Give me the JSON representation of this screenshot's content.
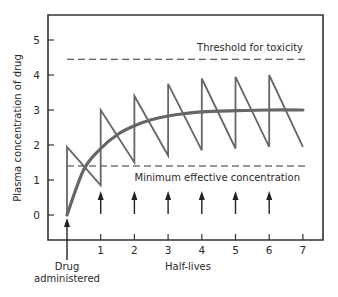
{
  "chart_data": {
    "type": "line",
    "title": "",
    "xlabel": "Half-lives",
    "ylabel": "Plasma concentration of drug",
    "xlim": [
      0,
      7
    ],
    "ylim": [
      0,
      5
    ],
    "x_ticks": [
      "1",
      "2",
      "3",
      "4",
      "5",
      "6",
      "7"
    ],
    "y_ticks": [
      "0",
      "1",
      "2",
      "3",
      "4",
      "5"
    ],
    "grid": false,
    "reference_lines": [
      {
        "name": "Threshold for toxicity",
        "y": 4.45,
        "style": "dashed"
      },
      {
        "name": "Minimum effective concentration",
        "y": 1.4,
        "style": "dashed"
      }
    ],
    "series": [
      {
        "name": "Intermittent dosing (sawtooth)",
        "x": [
          0,
          0,
          1,
          1,
          2,
          2,
          3,
          3,
          4,
          4,
          5,
          5,
          6,
          6,
          7
        ],
        "values": [
          0,
          1.95,
          0.85,
          3.0,
          1.5,
          3.4,
          1.7,
          3.75,
          1.85,
          3.9,
          1.9,
          3.95,
          1.95,
          4.0,
          1.95
        ]
      },
      {
        "name": "Continuous infusion (smooth)",
        "x": [
          0,
          0.5,
          1,
          1.5,
          2,
          2.5,
          3,
          3.5,
          4,
          5,
          6,
          7
        ],
        "values": [
          0,
          1.3,
          1.9,
          2.3,
          2.55,
          2.72,
          2.83,
          2.9,
          2.95,
          2.98,
          3.0,
          3.0
        ]
      }
    ],
    "dose_arrows_at": [
      0,
      1,
      2,
      3,
      4,
      5,
      6
    ],
    "annotations": [
      {
        "text": "Threshold for toxicity",
        "near_y": 4.45
      },
      {
        "text": "Minimum effective concentration",
        "near_y": 1.4
      },
      {
        "text": "Drug administered",
        "near_x": 0
      }
    ]
  },
  "labels": {
    "threshold": "Threshold for toxicity",
    "min_effective": "Minimum effective concentration",
    "xlabel": "Half-lives",
    "ylabel": "Plasma concentration of drug",
    "drug_line1": "Drug",
    "drug_line2": "administered"
  }
}
